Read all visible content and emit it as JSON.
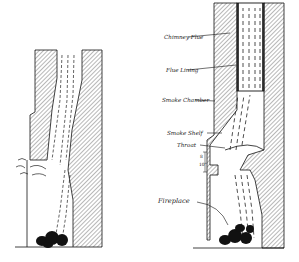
{
  "figure": {
    "left_diagram": {
      "description": "Incorrect construction: smoke spills into room"
    },
    "right_diagram": {
      "description": "Correct construction with smoke shelf and throat",
      "labels": [
        {
          "id": "chimney-flue",
          "text": "Chimney Flue"
        },
        {
          "id": "flue-lining",
          "text": "Flue Lining"
        },
        {
          "id": "smoke-chamber",
          "text": "Smoke Chamber"
        },
        {
          "id": "smoke-shelf",
          "text": "Smoke Shelf"
        },
        {
          "id": "throat",
          "text": "Throat"
        },
        {
          "id": "fireplace",
          "text": "Fireplace"
        }
      ],
      "dimension": {
        "text_top": "8",
        "text_bottom": "10\"",
        "label": "8 to 10\""
      }
    },
    "colors": {
      "ink": "#1a1a1a",
      "paper": "#ffffff"
    }
  }
}
